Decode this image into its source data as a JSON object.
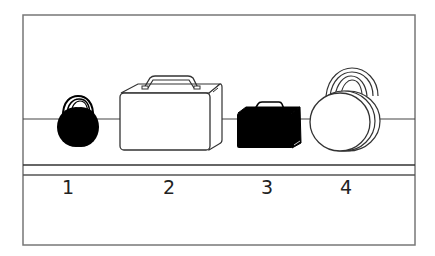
{
  "diagram": {
    "colors": {
      "stroke": "#333333",
      "fill_dark": "#000000",
      "fill_light": "#ffffff",
      "frame": "#777777"
    },
    "items": [
      {
        "number": "1",
        "object": "small round bag",
        "fill": "black"
      },
      {
        "number": "2",
        "object": "large suitcase",
        "fill": "white"
      },
      {
        "number": "3",
        "object": "small suitcase",
        "fill": "black"
      },
      {
        "number": "4",
        "object": "large round bag",
        "fill": "white"
      }
    ]
  }
}
